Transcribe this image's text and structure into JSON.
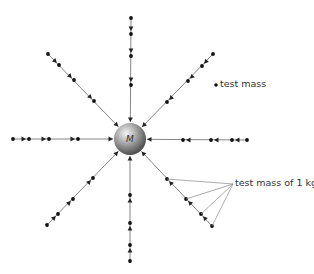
{
  "diagram": {
    "central_mass": {
      "label": "M",
      "cx": 130,
      "cy": 139,
      "r": 16
    },
    "labels": {
      "test_mass": "test mass",
      "test_mass_1kg": "test mass of 1 kg"
    },
    "colors": {
      "line": "#777777",
      "dot": "#111111",
      "arrow": "#222222",
      "text": "#333333"
    },
    "field_lines": [
      {
        "name": "top",
        "dots": [
          [
            131,
            18
          ],
          [
            131,
            34
          ],
          [
            131,
            56
          ],
          [
            131,
            85
          ]
        ]
      },
      {
        "name": "bottom",
        "dots": [
          [
            130,
            261
          ],
          [
            130,
            245
          ],
          [
            130,
            223
          ],
          [
            130,
            195
          ]
        ]
      },
      {
        "name": "left",
        "dots": [
          [
            13,
            139
          ],
          [
            29,
            139
          ],
          [
            49,
            139
          ],
          [
            78,
            139
          ]
        ]
      },
      {
        "name": "right",
        "dots": [
          [
            247,
            140
          ],
          [
            232,
            140
          ],
          [
            211,
            140
          ],
          [
            183,
            140
          ]
        ]
      },
      {
        "name": "upper-left",
        "dots": [
          [
            48,
            54
          ],
          [
            59,
            65
          ],
          [
            74,
            80
          ],
          [
            94,
            101
          ]
        ]
      },
      {
        "name": "upper-right",
        "dots": [
          [
            213,
            54
          ],
          [
            202,
            66
          ],
          [
            188,
            81
          ],
          [
            167,
            102
          ]
        ]
      },
      {
        "name": "lower-left",
        "dots": [
          [
            47,
            225
          ],
          [
            58,
            214
          ],
          [
            73,
            199
          ],
          [
            93,
            178
          ]
        ]
      },
      {
        "name": "lower-right",
        "dots": [
          [
            212,
            226
          ],
          [
            201,
            214
          ],
          [
            186,
            199
          ],
          [
            167,
            179
          ]
        ]
      }
    ],
    "legend_dot": [
      216,
      85
    ],
    "pointer_origin": [
      233,
      184
    ]
  }
}
